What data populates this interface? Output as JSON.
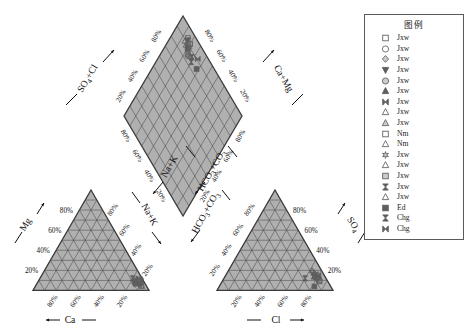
{
  "chart_data": {
    "type": "scatter",
    "plot_kind": "piper-trilinear-diagram",
    "title": "",
    "cation_triangle": {
      "name": "cation-triangle",
      "bottom_axis": {
        "label": "Ca",
        "arrow": "left",
        "ticks": [
          "80%",
          "60%",
          "40%",
          "20%"
        ]
      },
      "left_axis": {
        "label": "Mg",
        "arrow": "up",
        "ticks": [
          "20%",
          "40%",
          "60%",
          "80%"
        ]
      },
      "right_axis": {
        "label": "Na+K",
        "arrow": "down-right",
        "ticks": [
          "20%",
          "40%",
          "60%",
          "80%"
        ]
      },
      "points": [
        {
          "ca": 86,
          "mg": 9,
          "nak": 5
        },
        {
          "ca": 88,
          "mg": 7,
          "nak": 5
        },
        {
          "ca": 84,
          "mg": 11,
          "nak": 5
        },
        {
          "ca": 90,
          "mg": 6,
          "nak": 4
        },
        {
          "ca": 82,
          "mg": 10,
          "nak": 8
        },
        {
          "ca": 87,
          "mg": 8,
          "nak": 5
        },
        {
          "ca": 85,
          "mg": 12,
          "nak": 3
        },
        {
          "ca": 89,
          "mg": 7,
          "nak": 4
        },
        {
          "ca": 83,
          "mg": 9,
          "nak": 8
        },
        {
          "ca": 91,
          "mg": 5,
          "nak": 4
        },
        {
          "ca": 86,
          "mg": 10,
          "nak": 4
        },
        {
          "ca": 88,
          "mg": 6,
          "nak": 6
        },
        {
          "ca": 84,
          "mg": 8,
          "nak": 8
        },
        {
          "ca": 87,
          "mg": 11,
          "nak": 2
        },
        {
          "ca": 80,
          "mg": 12,
          "nak": 8
        },
        {
          "ca": 92,
          "mg": 4,
          "nak": 4
        },
        {
          "ca": 85,
          "mg": 7,
          "nak": 8
        },
        {
          "ca": 89,
          "mg": 9,
          "nak": 2
        },
        {
          "ca": 86,
          "mg": 6,
          "nak": 8
        }
      ]
    },
    "anion_triangle": {
      "name": "anion-triangle",
      "bottom_axis": {
        "label": "Cl",
        "arrow": "right",
        "ticks": [
          "20%",
          "40%",
          "60%",
          "80%"
        ]
      },
      "left_axis": {
        "label": "HCO₃+CO₃",
        "arrow": "down-left",
        "ticks": [
          "20%",
          "40%",
          "60%",
          "80%"
        ]
      },
      "right_axis": {
        "label": "SO₄",
        "arrow": "up",
        "ticks": [
          "20%",
          "40%",
          "60%",
          "80%"
        ]
      },
      "points": [
        {
          "cl": 78,
          "so4": 14,
          "hco3": 8
        },
        {
          "cl": 80,
          "so4": 12,
          "hco3": 8
        },
        {
          "cl": 76,
          "so4": 16,
          "hco3": 8
        },
        {
          "cl": 82,
          "so4": 11,
          "hco3": 7
        },
        {
          "cl": 74,
          "so4": 18,
          "hco3": 8
        },
        {
          "cl": 79,
          "so4": 13,
          "hco3": 8
        },
        {
          "cl": 77,
          "so4": 15,
          "hco3": 8
        },
        {
          "cl": 81,
          "so4": 12,
          "hco3": 7
        },
        {
          "cl": 75,
          "so4": 17,
          "hco3": 8
        },
        {
          "cl": 83,
          "so4": 10,
          "hco3": 7
        },
        {
          "cl": 78,
          "so4": 15,
          "hco3": 7
        },
        {
          "cl": 80,
          "so4": 13,
          "hco3": 7
        },
        {
          "cl": 72,
          "so4": 20,
          "hco3": 8
        },
        {
          "cl": 84,
          "so4": 9,
          "hco3": 7
        },
        {
          "cl": 70,
          "so4": 12,
          "hco3": 18
        },
        {
          "cl": 79,
          "so4": 16,
          "hco3": 5
        },
        {
          "cl": 82,
          "so4": 4,
          "hco3": 14
        },
        {
          "cl": 76,
          "so4": 14,
          "hco3": 10
        },
        {
          "cl": 80,
          "so4": 15,
          "hco3": 5
        }
      ]
    },
    "diamond": {
      "name": "diamond-field",
      "upper_left_axis": {
        "label": "SO₄+Cl",
        "arrow": "up-left",
        "ticks": [
          "20%",
          "40%",
          "60%",
          "80%"
        ]
      },
      "upper_right_axis": {
        "label": "Ca+Mg",
        "arrow": "up-right",
        "ticks": [
          "20%",
          "40%",
          "60%",
          "80%"
        ]
      },
      "lower_left_axis": {
        "label": "Na+K",
        "arrow": "down-left",
        "ticks": [
          "20%",
          "40%",
          "60%",
          "80%"
        ]
      },
      "lower_right_axis": {
        "label": "HCO₃+CO₃",
        "arrow": "down-right",
        "ticks": [
          "20%",
          "40%",
          "60%",
          "80%"
        ]
      },
      "points": [
        {
          "camg": 88,
          "so4cl": 80
        },
        {
          "camg": 90,
          "so4cl": 82
        },
        {
          "camg": 86,
          "so4cl": 78
        },
        {
          "camg": 92,
          "so4cl": 84
        },
        {
          "camg": 84,
          "so4cl": 76
        },
        {
          "camg": 89,
          "so4cl": 81
        },
        {
          "camg": 87,
          "so4cl": 79
        },
        {
          "camg": 91,
          "so4cl": 83
        },
        {
          "camg": 85,
          "so4cl": 77
        },
        {
          "camg": 93,
          "so4cl": 85
        },
        {
          "camg": 88,
          "so4cl": 83
        },
        {
          "camg": 90,
          "so4cl": 79
        },
        {
          "camg": 86,
          "so4cl": 74
        },
        {
          "camg": 92,
          "so4cl": 80
        },
        {
          "camg": 84,
          "so4cl": 70
        },
        {
          "camg": 89,
          "so4cl": 86
        },
        {
          "camg": 85,
          "so4cl": 62
        },
        {
          "camg": 87,
          "so4cl": 72
        },
        {
          "camg": 91,
          "so4cl": 66
        }
      ]
    }
  },
  "legend": {
    "title": "图例",
    "items": [
      {
        "symbol": "square-open",
        "label": "Jxw"
      },
      {
        "symbol": "circle-open",
        "label": "Jxw"
      },
      {
        "symbol": "diamond-light",
        "label": "Jxw"
      },
      {
        "symbol": "triangle-down-filled",
        "label": "Jxw"
      },
      {
        "symbol": "circle-light",
        "label": "Jxw"
      },
      {
        "symbol": "triangle-up-filled",
        "label": "Jxw"
      },
      {
        "symbol": "hourglass-filled",
        "label": "Jxw"
      },
      {
        "symbol": "triangle-up-open",
        "label": "Jxw"
      },
      {
        "symbol": "triangle-up-light",
        "label": "Jxw"
      },
      {
        "symbol": "square-open",
        "label": "Nm"
      },
      {
        "symbol": "triangle-up-open",
        "label": "Nm"
      },
      {
        "symbol": "star-light",
        "label": "Jxw"
      },
      {
        "symbol": "triangle-up-open",
        "label": "Jxw"
      },
      {
        "symbol": "square-light",
        "label": "Jxw"
      },
      {
        "symbol": "bowtie-filled",
        "label": "Jxw"
      },
      {
        "symbol": "triangle-up-small",
        "label": "Jxw"
      },
      {
        "symbol": "square-filled",
        "label": "Ed"
      },
      {
        "symbol": "bowtie-filled",
        "label": "Chg"
      },
      {
        "symbol": "hourglass-filled",
        "label": "Chg"
      }
    ]
  },
  "colors": {
    "fill": "#b0b0b0",
    "grid": "#4a4a4a",
    "outline": "#3a3a3a",
    "text": "#111111",
    "legend_border": "#5a5a5a",
    "marker": "#5e5e5e"
  }
}
